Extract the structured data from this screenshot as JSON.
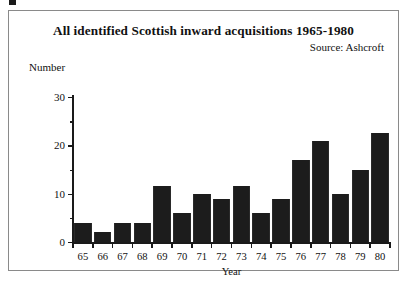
{
  "figure": {
    "title": "All identified Scottish inward acquisitions 1965-1980",
    "source": "Source: Ashcroft",
    "y_axis_caption": "Number",
    "x_axis_title": "Year"
  },
  "chart_data": {
    "type": "bar",
    "title": "All identified Scottish inward acquisitions 1965-1980",
    "subtitle": "Source: Ashcroft",
    "xlabel": "Year",
    "ylabel": "Number",
    "ylim": [
      0,
      30
    ],
    "yticks": [
      0,
      10,
      20,
      30
    ],
    "yticks_minor": [
      5,
      15,
      25
    ],
    "grid": false,
    "legend": null,
    "bar_color": "#1c1c1c",
    "background": "#ffffff",
    "categories": [
      "65",
      "66",
      "67",
      "68",
      "69",
      "70",
      "71",
      "72",
      "73",
      "74",
      "75",
      "76",
      "77",
      "78",
      "79",
      "80"
    ],
    "values": [
      4,
      2,
      4,
      4,
      11.5,
      6,
      10,
      9,
      11.5,
      6,
      9,
      17,
      21,
      10,
      15,
      22.5
    ]
  }
}
